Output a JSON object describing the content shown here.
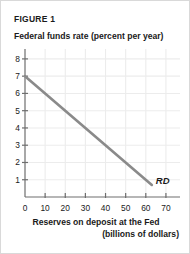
{
  "figure": {
    "number_label": "FIGURE 1",
    "curve_label": "RD"
  },
  "colors": {
    "curve": "#8a8a8a",
    "axis": "#6e6e6e",
    "grid": "#ececec",
    "text": "#1a1a1a",
    "background": "#ffffff",
    "border": "#d9d9d9"
  },
  "chart_data": {
    "type": "line",
    "title": "FIGURE 1",
    "subtitle": "",
    "xlabel_line1": "Reserves on deposit at the Fed",
    "xlabel_line2": "(billions of dollars)",
    "ylabel": "Federal funds rate (percent per year)",
    "xlim": [
      0,
      75
    ],
    "ylim": [
      0,
      8.4
    ],
    "xticks": [
      0,
      10,
      20,
      30,
      40,
      50,
      60,
      70
    ],
    "xtick_labels": [
      "0",
      "10",
      "20",
      "30",
      "40",
      "50",
      "60",
      "70"
    ],
    "yticks": [
      1,
      2,
      3,
      4,
      5,
      6,
      7,
      8
    ],
    "ytick_labels": [
      "1",
      "2",
      "3",
      "4",
      "5",
      "6",
      "7",
      "8"
    ],
    "grid": true,
    "legend": "none",
    "series": [
      {
        "name": "RD",
        "label": "RD",
        "annotation": "RD",
        "x": [
          0,
          63
        ],
        "y": [
          7,
          0.7
        ],
        "color": "#8a8a8a",
        "linewidth": 2.6
      }
    ],
    "annotations": [
      {
        "text": "RD",
        "x": 65,
        "y": 0.95,
        "style": "bold-italic"
      }
    ]
  }
}
